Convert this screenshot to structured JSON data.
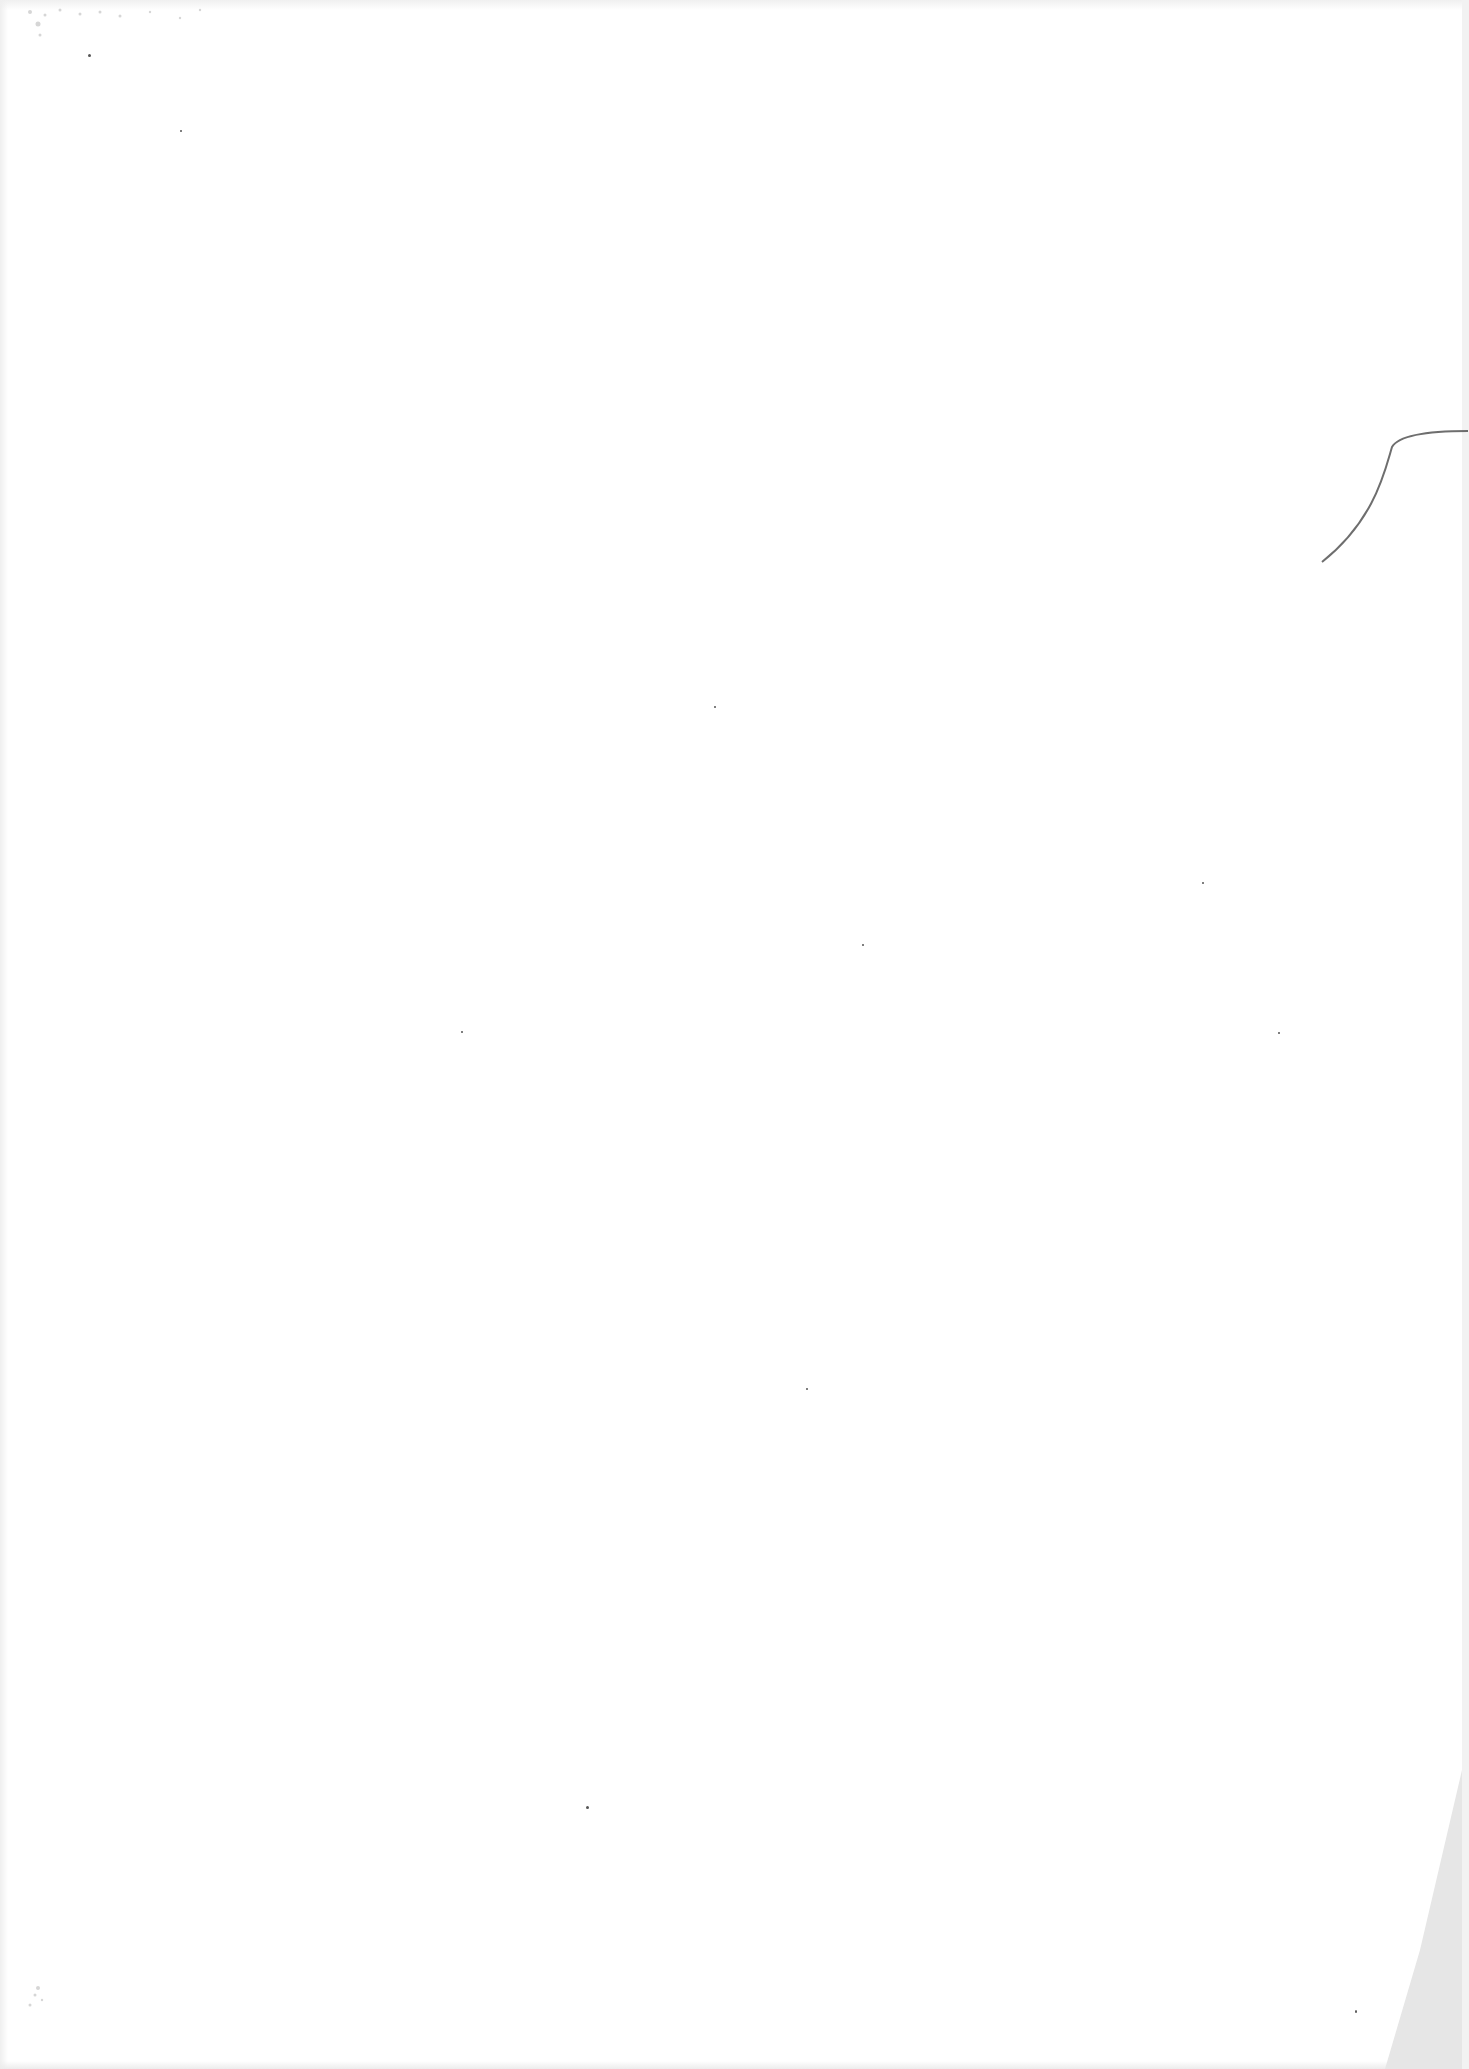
{
  "page": {
    "text": ""
  }
}
